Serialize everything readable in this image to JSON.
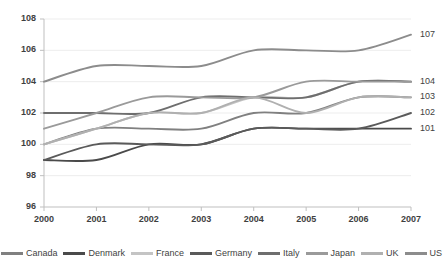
{
  "chart_data": {
    "type": "line",
    "title": "",
    "xlabel": "",
    "ylabel": "",
    "categories": [
      "2000",
      "2001",
      "2002",
      "2003",
      "2004",
      "2005",
      "2006",
      "2007"
    ],
    "ylim": [
      96,
      108
    ],
    "yticks": [
      96,
      98,
      100,
      102,
      104,
      106,
      108
    ],
    "grid": true,
    "legend_position": "bottom",
    "series": [
      {
        "name": "Canada",
        "color": "#808080",
        "values": [
          100,
          101,
          101,
          101,
          102,
          102,
          103,
          103
        ]
      },
      {
        "name": "Denmark",
        "color": "#4a4a4a",
        "values": [
          99,
          99,
          100,
          100,
          101,
          101,
          101,
          101
        ]
      },
      {
        "name": "France",
        "color": "#c4c4c4",
        "values": [
          100,
          101,
          102,
          102,
          103,
          103,
          104,
          104
        ]
      },
      {
        "name": "Germany",
        "color": "#5a5a5a",
        "values": [
          99,
          100,
          100,
          100,
          101,
          101,
          101,
          102
        ]
      },
      {
        "name": "Italy",
        "color": "#6e6e6e",
        "values": [
          102,
          102,
          102,
          103,
          103,
          103,
          104,
          104
        ]
      },
      {
        "name": "Japan",
        "color": "#9a9a9a",
        "values": [
          101,
          102,
          103,
          103,
          103,
          104,
          104,
          104
        ]
      },
      {
        "name": "UK",
        "color": "#b0b0b0",
        "values": [
          100,
          101,
          102,
          102,
          103,
          102,
          103,
          103
        ]
      },
      {
        "name": "US",
        "color": "#8c8c8c",
        "values": [
          104,
          105,
          105,
          105,
          106,
          106,
          106,
          107
        ]
      }
    ],
    "end_labels": [
      {
        "value": "107",
        "at": 107
      },
      {
        "value": "104",
        "at": 104
      },
      {
        "value": "103",
        "at": 103
      },
      {
        "value": "102",
        "at": 102
      },
      {
        "value": "101",
        "at": 101
      }
    ],
    "axis_color": "#bfbfbf",
    "grid_color": "#ededed",
    "tick_text_color": "#3f3f3f",
    "background": "#ffffff"
  },
  "legend": {
    "items": [
      {
        "label": "Canada"
      },
      {
        "label": "Denmark"
      },
      {
        "label": "France"
      },
      {
        "label": "Germany"
      },
      {
        "label": "Italy"
      },
      {
        "label": "Japan"
      },
      {
        "label": "UK"
      },
      {
        "label": "US"
      }
    ]
  }
}
